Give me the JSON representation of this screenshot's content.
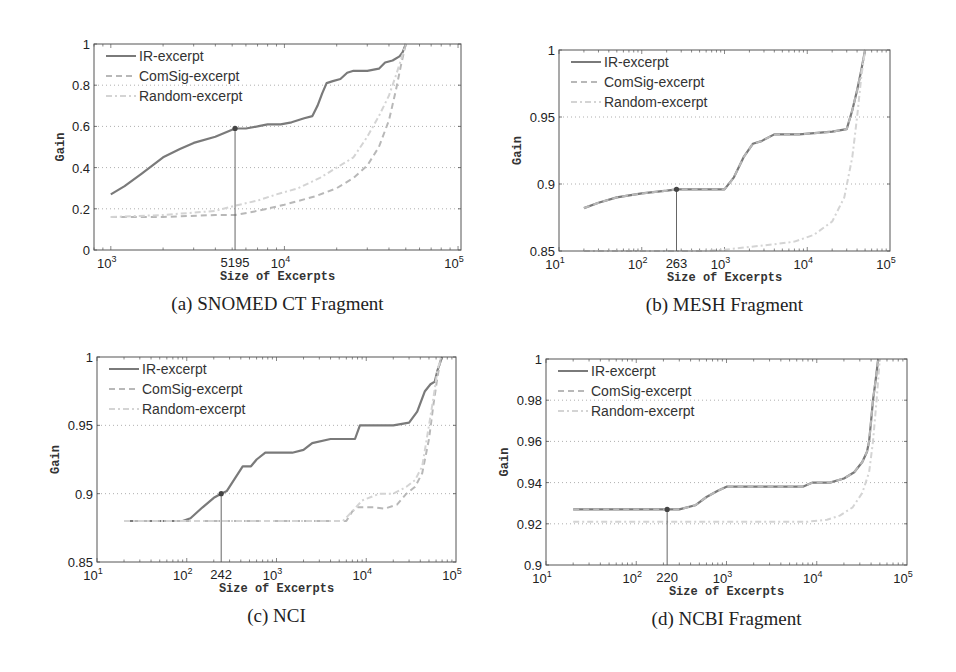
{
  "figure": {
    "legend": [
      "IR-excerpt",
      "ComSig-excerpt",
      "Random-excerpt"
    ],
    "xlabel": "Size of Excerpts",
    "ylabel": "Gain",
    "colors": {
      "ir": "#7a7a7a",
      "comsig": "#b8b8b8",
      "random": "#d4d4d4",
      "grid": "#9a9a9a",
      "axis": "#555555",
      "marker": "#444444"
    }
  },
  "chart_data": [
    {
      "type": "line",
      "caption": "(a) SNOMED CT Fragment",
      "title": "SNOMED CT Fragment",
      "xlabel": "Size of Excerpts",
      "ylabel": "Gain",
      "xscale": "log",
      "xlim": [
        800,
        104000
      ],
      "ylim": [
        0,
        1
      ],
      "yticks": [
        0,
        0.2,
        0.4,
        0.6,
        0.8,
        1
      ],
      "ytick_labels": [
        "0",
        "0.2",
        "0.4",
        "0.6",
        "0.8",
        "1"
      ],
      "xticks": [
        {
          "v": 1000,
          "base": "10",
          "exp": "3"
        },
        {
          "v": 5195,
          "text": "5195"
        },
        {
          "v": 10000,
          "base": "10",
          "exp": "4"
        },
        {
          "v": 100000,
          "base": "10",
          "exp": "5"
        }
      ],
      "grid": true,
      "legend_position": "upper left",
      "marker": {
        "x": 5195,
        "y": 0.59,
        "label": "5195"
      },
      "box": {
        "left": 94,
        "top": 44,
        "right": 461,
        "bottom": 250
      },
      "series": [
        {
          "name": "IR-excerpt",
          "style": "solid",
          "x": [
            1000,
            1200,
            1500,
            2000,
            2500,
            3000,
            4000,
            5195,
            6000,
            7000,
            8000,
            9500,
            11000,
            13000,
            14500,
            15500,
            16500,
            17500,
            19000,
            21000,
            23000,
            25000,
            30000,
            35000,
            38000,
            42000,
            46000,
            48000,
            50000
          ],
          "y": [
            0.27,
            0.31,
            0.37,
            0.45,
            0.49,
            0.52,
            0.55,
            0.59,
            0.59,
            0.6,
            0.61,
            0.61,
            0.62,
            0.64,
            0.65,
            0.7,
            0.76,
            0.81,
            0.82,
            0.83,
            0.86,
            0.87,
            0.87,
            0.88,
            0.91,
            0.92,
            0.94,
            0.96,
            1.0
          ]
        },
        {
          "name": "ComSig-excerpt",
          "style": "dashed",
          "x": [
            1000,
            2000,
            4000,
            5195,
            7000,
            10000,
            15000,
            20000,
            25000,
            30000,
            35000,
            40000,
            44000,
            47000,
            50000
          ],
          "y": [
            0.16,
            0.16,
            0.17,
            0.17,
            0.19,
            0.22,
            0.26,
            0.3,
            0.35,
            0.41,
            0.5,
            0.63,
            0.78,
            0.9,
            1.0
          ]
        },
        {
          "name": "Random-excerpt",
          "style": "dashdot",
          "x": [
            1000,
            2000,
            4000,
            5500,
            7000,
            9000,
            12000,
            16000,
            20000,
            25000,
            30000,
            35000,
            40000,
            44000,
            48000,
            50000
          ],
          "y": [
            0.16,
            0.17,
            0.19,
            0.22,
            0.24,
            0.27,
            0.3,
            0.35,
            0.4,
            0.45,
            0.55,
            0.65,
            0.75,
            0.85,
            0.95,
            1.0
          ]
        }
      ]
    },
    {
      "type": "line",
      "caption": "(b) MESH Fragment",
      "title": "MESH Fragment",
      "xlabel": "Size of Excerpts",
      "ylabel": "Gain",
      "xscale": "log",
      "xlim": [
        10,
        100000
      ],
      "ylim": [
        0.85,
        1
      ],
      "yticks": [
        0.85,
        0.9,
        0.95,
        1
      ],
      "ytick_labels": [
        "0.85",
        "0.9",
        "0.95",
        "1"
      ],
      "xticks": [
        {
          "v": 10,
          "base": "10",
          "exp": "1"
        },
        {
          "v": 100,
          "base": "10",
          "exp": "2"
        },
        {
          "v": 263,
          "text": "263"
        },
        {
          "v": 1000,
          "base": "10",
          "exp": "3"
        },
        {
          "v": 10000,
          "base": "10",
          "exp": "4"
        },
        {
          "v": 100000,
          "base": "10",
          "exp": "5"
        }
      ],
      "grid": true,
      "legend_position": "upper left",
      "marker": {
        "x": 263,
        "y": 0.896,
        "label": "263"
      },
      "box": {
        "left": 559,
        "top": 50,
        "right": 890,
        "bottom": 251
      },
      "series": [
        {
          "name": "IR-excerpt",
          "style": "solid",
          "x": [
            20,
            30,
            50,
            100,
            200,
            263,
            500,
            1000,
            1300,
            1700,
            2200,
            2800,
            4000,
            8000,
            20000,
            30000,
            35000,
            40000,
            45000,
            50000
          ],
          "y": [
            0.882,
            0.886,
            0.89,
            0.893,
            0.895,
            0.896,
            0.896,
            0.896,
            0.905,
            0.92,
            0.93,
            0.932,
            0.937,
            0.937,
            0.939,
            0.941,
            0.955,
            0.97,
            0.985,
            1.0
          ]
        },
        {
          "name": "ComSig-excerpt",
          "style": "dashed",
          "x": [
            20,
            30,
            50,
            100,
            200,
            263,
            500,
            1000,
            1300,
            1700,
            2200,
            2800,
            4000,
            8000,
            20000,
            30000,
            35000,
            40000,
            45000,
            50000
          ],
          "y": [
            0.882,
            0.886,
            0.89,
            0.893,
            0.895,
            0.896,
            0.896,
            0.896,
            0.905,
            0.92,
            0.93,
            0.932,
            0.937,
            0.937,
            0.939,
            0.941,
            0.955,
            0.97,
            0.985,
            1.0
          ]
        },
        {
          "name": "Random-excerpt",
          "style": "dashdot",
          "x": [
            20,
            100,
            500,
            1000,
            2000,
            4000,
            7000,
            12000,
            20000,
            28000,
            35000,
            40000,
            45000,
            50000
          ],
          "y": [
            0.85,
            0.85,
            0.85,
            0.851,
            0.853,
            0.855,
            0.857,
            0.862,
            0.872,
            0.89,
            0.92,
            0.95,
            0.98,
            1.0
          ]
        }
      ]
    },
    {
      "type": "line",
      "caption": "(c) NCI",
      "title": "NCI",
      "xlabel": "Size of Excerpts",
      "ylabel": "Gain",
      "xscale": "log",
      "xlim": [
        10,
        100000
      ],
      "ylim": [
        0.85,
        1
      ],
      "yticks": [
        0.85,
        0.9,
        0.95,
        1
      ],
      "ytick_labels": [
        "0.85",
        "0.9",
        "0.95",
        "1"
      ],
      "xticks": [
        {
          "v": 10,
          "base": "10",
          "exp": "1"
        },
        {
          "v": 100,
          "base": "10",
          "exp": "2"
        },
        {
          "v": 242,
          "text": "242"
        },
        {
          "v": 1000,
          "base": "10",
          "exp": "3"
        },
        {
          "v": 10000,
          "base": "10",
          "exp": "4"
        },
        {
          "v": 100000,
          "base": "10",
          "exp": "5"
        }
      ],
      "grid": true,
      "legend_position": "upper left",
      "marker": {
        "x": 242,
        "y": 0.9,
        "label": "242"
      },
      "box": {
        "left": 97,
        "top": 357,
        "right": 456,
        "bottom": 562
      },
      "series": [
        {
          "name": "IR-excerpt",
          "style": "solid",
          "x": [
            20,
            50,
            90,
            110,
            150,
            200,
            242,
            280,
            350,
            420,
            520,
            600,
            750,
            1500,
            2000,
            2500,
            4000,
            7500,
            8500,
            12000,
            20000,
            30000,
            37000,
            45000,
            52000,
            58000,
            62000,
            70000
          ],
          "y": [
            0.88,
            0.88,
            0.88,
            0.882,
            0.89,
            0.897,
            0.9,
            0.902,
            0.912,
            0.92,
            0.92,
            0.925,
            0.93,
            0.93,
            0.932,
            0.937,
            0.94,
            0.94,
            0.95,
            0.95,
            0.95,
            0.952,
            0.96,
            0.975,
            0.98,
            0.982,
            0.99,
            1.0
          ]
        },
        {
          "name": "ComSig-excerpt",
          "style": "dashed",
          "x": [
            20,
            100,
            500,
            2000,
            6000,
            7000,
            8000,
            12000,
            16000,
            22000,
            28000,
            35000,
            42000,
            50000,
            56000,
            62000,
            68000
          ],
          "y": [
            0.88,
            0.88,
            0.88,
            0.88,
            0.88,
            0.887,
            0.89,
            0.89,
            0.889,
            0.892,
            0.9,
            0.905,
            0.915,
            0.94,
            0.965,
            0.985,
            1.0
          ]
        },
        {
          "name": "Random-excerpt",
          "style": "dashdot",
          "x": [
            20,
            100,
            500,
            2000,
            5500,
            7000,
            9000,
            14000,
            20000,
            28000,
            35000,
            42000,
            50000,
            56000,
            62000,
            68000
          ],
          "y": [
            0.88,
            0.88,
            0.88,
            0.88,
            0.88,
            0.887,
            0.895,
            0.9,
            0.9,
            0.905,
            0.91,
            0.92,
            0.95,
            0.97,
            0.99,
            1.0
          ]
        }
      ]
    },
    {
      "type": "line",
      "caption": "(d) NCBI Fragment",
      "title": "NCBI Fragment",
      "xlabel": "Size of Excerpts",
      "ylabel": "Gain",
      "xscale": "log",
      "xlim": [
        10,
        100000
      ],
      "ylim": [
        0.9,
        1
      ],
      "yticks": [
        0.9,
        0.92,
        0.94,
        0.96,
        0.98,
        1
      ],
      "ytick_labels": [
        "0.9",
        "0.92",
        "0.94",
        "0.96",
        "0.98",
        "1"
      ],
      "xticks": [
        {
          "v": 10,
          "base": "10",
          "exp": "1"
        },
        {
          "v": 100,
          "base": "10",
          "exp": "2"
        },
        {
          "v": 220,
          "text": "220"
        },
        {
          "v": 1000,
          "base": "10",
          "exp": "3"
        },
        {
          "v": 10000,
          "base": "10",
          "exp": "4"
        },
        {
          "v": 100000,
          "base": "10",
          "exp": "5"
        }
      ],
      "grid": true,
      "legend_position": "upper left",
      "marker": {
        "x": 220,
        "y": 0.927,
        "label": "220"
      },
      "box": {
        "left": 546,
        "top": 359,
        "right": 907,
        "bottom": 565
      },
      "series": [
        {
          "name": "IR-excerpt",
          "style": "solid",
          "x": [
            20,
            50,
            100,
            220,
            300,
            450,
            600,
            800,
            1000,
            2000,
            4000,
            7000,
            9000,
            14000,
            20000,
            26000,
            32000,
            36000,
            38000,
            40000,
            42000,
            45000,
            48000
          ],
          "y": [
            0.927,
            0.927,
            0.927,
            0.927,
            0.927,
            0.929,
            0.933,
            0.936,
            0.938,
            0.938,
            0.938,
            0.938,
            0.94,
            0.94,
            0.942,
            0.945,
            0.95,
            0.955,
            0.96,
            0.97,
            0.98,
            0.99,
            1.0
          ]
        },
        {
          "name": "ComSig-excerpt",
          "style": "dashed",
          "x": [
            20,
            50,
            100,
            220,
            300,
            450,
            600,
            800,
            1000,
            2000,
            4000,
            7000,
            9000,
            14000,
            20000,
            26000,
            32000,
            36000,
            38000,
            40000,
            42000,
            45000,
            48000
          ],
          "y": [
            0.927,
            0.927,
            0.927,
            0.927,
            0.927,
            0.929,
            0.933,
            0.936,
            0.938,
            0.938,
            0.938,
            0.938,
            0.94,
            0.94,
            0.942,
            0.945,
            0.95,
            0.955,
            0.96,
            0.97,
            0.98,
            0.99,
            1.0
          ]
        },
        {
          "name": "Random-excerpt",
          "style": "dashdot",
          "x": [
            20,
            100,
            500,
            1000,
            3000,
            8000,
            13000,
            18000,
            25000,
            32000,
            38000,
            42000,
            46000,
            50000
          ],
          "y": [
            0.921,
            0.921,
            0.921,
            0.921,
            0.921,
            0.921,
            0.922,
            0.924,
            0.928,
            0.935,
            0.945,
            0.96,
            0.98,
            1.0
          ]
        }
      ]
    }
  ]
}
